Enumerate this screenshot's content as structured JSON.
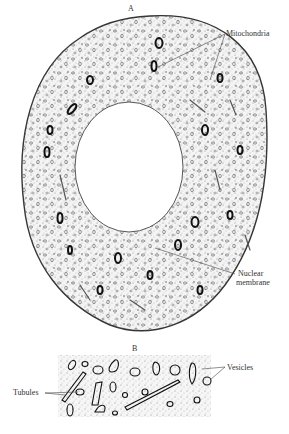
{
  "figure": {
    "panel_a": {
      "label": "A",
      "labels": {
        "mitochondria": "Mitochondria",
        "nuclear_membrane_1": "Nuclear",
        "nuclear_membrane_2": "membrane"
      }
    },
    "panel_b": {
      "label": "B",
      "labels": {
        "vesicles": "Vesicles",
        "tubules": "Tubules"
      }
    }
  }
}
